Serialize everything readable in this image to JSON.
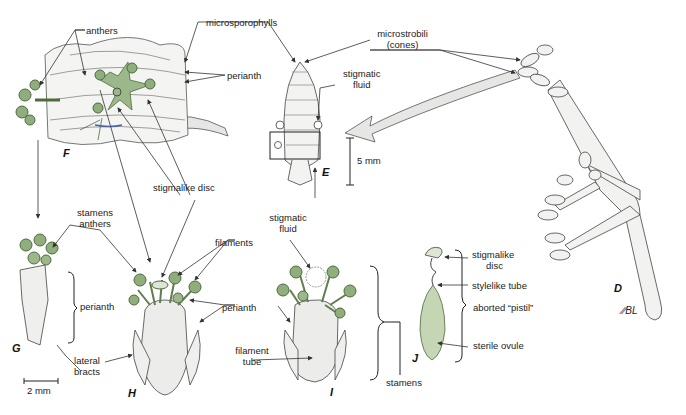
{
  "figure_letters": {
    "D": "D",
    "E": "E",
    "F": "F",
    "G": "G",
    "H": "H",
    "I": "I",
    "J": "J"
  },
  "labels": {
    "anthers_top": "anthers",
    "microsporophylls": "microsporophylls",
    "perianth_F": "perianth",
    "microstrobili_1": "microstrobili",
    "microstrobili_2": "(cones)",
    "stigmatic_fluid_E_1": "stigmatic",
    "stigmatic_fluid_E_2": "fluid",
    "scale_5mm": "5 mm",
    "stigmalike_disc_F": "stigmalike disc",
    "stigmatic_fluid_I_1": "stigmatic",
    "stigmatic_fluid_I_2": "fluid",
    "stamens_G": "stamens",
    "anthers_G": "anthers",
    "perianth_G": "perianth",
    "lateral_bracts_1": "lateral",
    "lateral_bracts_2": "bracts",
    "scale_2mm": "2 mm",
    "filaments": "filaments",
    "perianth_H": "perianth",
    "perianth_I": "perianth",
    "filament_tube_1": "filament",
    "filament_tube_2": "tube",
    "stamens_I": "stamens",
    "stigmalike_disc_J_1": "stigmalike",
    "stigmalike_disc_J_2": "disc",
    "stylelike_tube": "stylelike tube",
    "aborted_pistil": "aborted “pistil”",
    "sterile_ovule": "sterile ovule",
    "signature": "∕∕BL"
  },
  "colors": {
    "green": "#9cb88a",
    "green_dark": "#5f7d4f",
    "gray_fill": "#ececea",
    "line": "#333333",
    "arrow_fill": "#e6e6e4"
  }
}
